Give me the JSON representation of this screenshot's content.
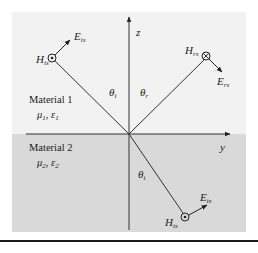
{
  "diagram": {
    "colors": {
      "material1_bg": "#f2f2f2",
      "material2_bg": "#d9d9d9",
      "line": "#333333",
      "rule": "#1a1a1a"
    },
    "axes": {
      "z_label": "z",
      "y_label": "y"
    },
    "material1": {
      "name": "Material 1",
      "params": "μ1, ε1",
      "mu": "μ",
      "mu_sub": "1",
      "eps": "ε",
      "eps_sub": "1"
    },
    "material2": {
      "name": "Material 2",
      "params": "μ2, ε2",
      "mu": "μ",
      "mu_sub": "2",
      "eps": "ε",
      "eps_sub": "2"
    },
    "angles": {
      "incident": {
        "sym": "θ",
        "sub": "i"
      },
      "reflected": {
        "sym": "θ",
        "sub": "r"
      },
      "transmitted": {
        "sym": "θ",
        "sub": "t"
      }
    },
    "waves": {
      "incident": {
        "E": {
          "sym": "E",
          "sub": "is"
        },
        "H": {
          "sym": "H",
          "sub": "is"
        },
        "h_direction": "out-of-page"
      },
      "reflected": {
        "E": {
          "sym": "E",
          "sub": "rs"
        },
        "H": {
          "sym": "H",
          "sub": "rs"
        },
        "h_direction": "into-page"
      },
      "transmitted": {
        "E": {
          "sym": "E",
          "sub": "ts"
        },
        "H": {
          "sym": "H",
          "sub": "ts"
        },
        "h_direction": "out-of-page"
      }
    }
  }
}
